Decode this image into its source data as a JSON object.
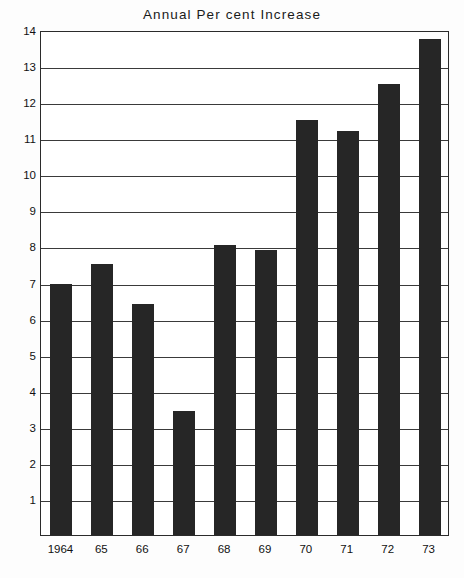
{
  "chart_data": {
    "type": "bar",
    "title": "Annual Per cent Increase",
    "xlabel": "",
    "ylabel": "",
    "categories": [
      "1964",
      "65",
      "66",
      "67",
      "68",
      "69",
      "70",
      "71",
      "72",
      "73"
    ],
    "values": [
      6.95,
      7.5,
      6.4,
      3.45,
      8.05,
      7.9,
      11.5,
      11.2,
      12.5,
      13.75
    ],
    "ylim": [
      0,
      14
    ],
    "ytick_labels": [
      "14",
      "13",
      "12",
      "11",
      "10",
      "9",
      "8",
      "7",
      "6",
      "5",
      "4",
      "3",
      "2",
      "1"
    ],
    "ytick_values": [
      14,
      13,
      12,
      11,
      10,
      9,
      8,
      7,
      6,
      5,
      4,
      3,
      2,
      1
    ],
    "grid": true,
    "legend": "none",
    "bar_color": "#262626",
    "axis_color": "#2b2b2b",
    "background_color": "#ffffff"
  }
}
